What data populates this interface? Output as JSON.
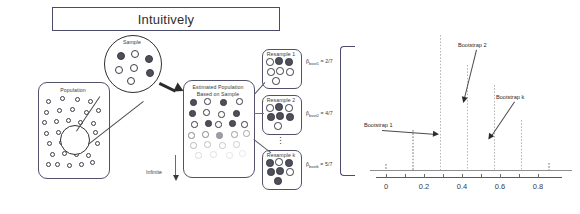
{
  "header": {
    "title": "Intuitively"
  },
  "diagram": {
    "population_label": "Population",
    "sample_label": "Sample",
    "estimated_population_label_line1": "Estimated Population",
    "estimated_population_label_line2": "Based on Sample",
    "infinite_label": "Infinite",
    "vertical_ellipsis": "⋮",
    "resamples": [
      {
        "box_label": "Resample 1",
        "stat_label": "p̂",
        "stat_sub": "boot1",
        "stat_value": "= 2/7"
      },
      {
        "box_label": "Resample 2",
        "stat_label": "p̂",
        "stat_sub": "boot2",
        "stat_value": "= 4/7"
      },
      {
        "box_label": "Resample k",
        "stat_label": "p̂",
        "stat_sub": "bootk",
        "stat_value": "= 5/7"
      }
    ]
  },
  "chart_data": {
    "type": "bar",
    "title": "",
    "xlabel": "",
    "ylabel": "",
    "xlim": [
      -0.08,
      0.95
    ],
    "ylim": [
      0,
      14
    ],
    "grid": false,
    "legend": "none",
    "tick_labels": [
      "0",
      "0.2",
      "0.4",
      "0.6",
      "0.8"
    ],
    "tick_values": [
      0,
      0.2,
      0.4,
      0.6,
      0.8
    ],
    "x": [
      0.0,
      0.143,
      0.286,
      0.429,
      0.571,
      0.714,
      0.857
    ],
    "values": [
      0.6,
      4.0,
      13.5,
      10.5,
      8.5,
      5.0,
      0.7
    ],
    "annotations": [
      {
        "text": "Bootstrap 1",
        "points_to_x": 0.286,
        "points_to_y": 3.6
      },
      {
        "text": "Bootstrap 2",
        "points_to_x": 0.429,
        "points_to_y": 7.0
      },
      {
        "text": "Bootstrap k",
        "points_to_x": 0.571,
        "points_to_y": 3.3
      }
    ]
  },
  "colors": {
    "title_border": "#4a4a6a",
    "box_border": "#51516b",
    "dot_dark": "#4f4f5a",
    "dot_light": "#ffffff",
    "bar": "#b9b9b9",
    "axis": "#6a6a6a"
  }
}
